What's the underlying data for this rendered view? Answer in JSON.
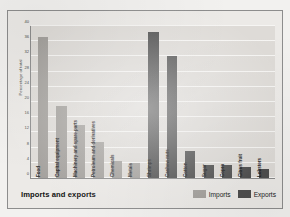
{
  "figure": {
    "title": "Imports and exports",
    "y_axis_title": "Percentage of total"
  },
  "legend": {
    "position": "bottom-right",
    "entries": [
      {
        "label": "Imports",
        "color": "#a3a09c"
      },
      {
        "label": "Exports",
        "color": "#4e4e4e"
      }
    ]
  },
  "chart_data": {
    "type": "bar",
    "title": "Imports and exports",
    "xlabel": "",
    "ylabel": "Percentage of total",
    "ylim": [
      0,
      40
    ],
    "yticks": [
      0,
      4,
      8,
      12,
      16,
      20,
      24,
      28,
      32,
      36,
      40
    ],
    "ytick_labels": [
      "0",
      "4",
      "8",
      "12",
      "16",
      "20",
      "24",
      "28",
      "32",
      "36",
      "40"
    ],
    "grid": true,
    "legend_position": "bottom-right",
    "categories": [
      "Food",
      "Capital equipment",
      "Machinery and spare parts",
      "Petroleum and derivatives",
      "Chemicals",
      "Metals",
      "Shrimps",
      "Cashew nuts",
      "Cotton",
      "Sugar",
      "Copra",
      "Citrus fruit",
      "Lobsters"
    ],
    "series": [
      {
        "name": "Imports",
        "color": "#a3a09c",
        "values": [
          37,
          19,
          14,
          9.5,
          4.5,
          4,
          null,
          null,
          null,
          null,
          null,
          null,
          null
        ]
      },
      {
        "name": "Exports",
        "color": "#4e4e4e",
        "values": [
          null,
          null,
          null,
          null,
          null,
          null,
          38.5,
          32,
          7,
          3.5,
          3.5,
          3,
          2.5
        ]
      }
    ],
    "bars": [
      {
        "category": "Food",
        "series": "Imports",
        "value": 37,
        "color": "#a3a09c"
      },
      {
        "category": "Capital equipment",
        "series": "Imports",
        "value": 19,
        "color": "#a3a09c"
      },
      {
        "category": "Machinery and spare parts",
        "series": "Imports",
        "value": 14,
        "color": "#a3a09c"
      },
      {
        "category": "Petroleum and derivatives",
        "series": "Imports",
        "value": 9.5,
        "color": "#a3a09c"
      },
      {
        "category": "Chemicals",
        "series": "Imports",
        "value": 4.5,
        "color": "#a3a09c"
      },
      {
        "category": "Metals",
        "series": "Imports",
        "value": 4,
        "color": "#a3a09c"
      },
      {
        "category": "Shrimps",
        "series": "Exports",
        "value": 38.5,
        "color": "#4e4e4e"
      },
      {
        "category": "Cashew nuts",
        "series": "Exports",
        "value": 32,
        "color": "#4e4e4e"
      },
      {
        "category": "Cotton",
        "series": "Exports",
        "value": 7,
        "color": "#4e4e4e"
      },
      {
        "category": "Sugar",
        "series": "Exports",
        "value": 3.5,
        "color": "#4e4e4e"
      },
      {
        "category": "Copra",
        "series": "Exports",
        "value": 3.5,
        "color": "#4e4e4e"
      },
      {
        "category": "Citrus fruit",
        "series": "Exports",
        "value": 3,
        "color": "#4e4e4e"
      },
      {
        "category": "Lobsters",
        "series": "Exports",
        "value": 2.5,
        "color": "#4e4e4e"
      }
    ]
  }
}
